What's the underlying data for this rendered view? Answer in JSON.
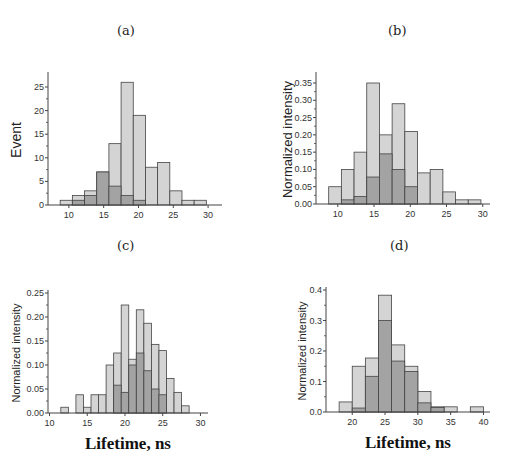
{
  "panels": [
    {
      "id": "a",
      "label": "(a)"
    },
    {
      "id": "b",
      "label": "(b)"
    },
    {
      "id": "c",
      "label": "(c)"
    },
    {
      "id": "d",
      "label": "(d)"
    }
  ],
  "colors": {
    "light_bar": "#d4d4d4",
    "dark_bar": "#a3a3a3",
    "bar_edge": "#444444",
    "axis": "#444444"
  },
  "chart_data": [
    {
      "panel": "(a)",
      "type": "bar",
      "subtype": "overlaid histogram",
      "title": "(a)",
      "xlabel": "",
      "ylabel": "Event",
      "xlim": [
        7,
        32
      ],
      "ylim": [
        0,
        27
      ],
      "xticks": [
        10,
        15,
        20,
        25,
        30
      ],
      "yticks": [
        0,
        5,
        10,
        15,
        20,
        25
      ],
      "bin_edges": [
        8.75,
        10.5,
        12.25,
        14.0,
        15.75,
        17.5,
        19.25,
        21.0,
        22.75,
        24.5,
        26.25,
        28.0,
        29.75
      ],
      "series": [
        {
          "name": "light",
          "values": [
            1,
            2,
            3,
            7,
            13,
            26,
            19,
            8,
            9,
            3,
            1,
            1
          ]
        },
        {
          "name": "dark",
          "values": [
            0,
            1,
            2,
            7,
            4,
            2,
            1,
            0,
            0,
            0,
            0,
            0
          ]
        }
      ]
    },
    {
      "panel": "(b)",
      "type": "bar",
      "subtype": "overlaid histogram",
      "title": "(b)",
      "xlabel": "",
      "ylabel": "Normalized intensity",
      "xlim": [
        7,
        31
      ],
      "ylim": [
        0,
        0.37
      ],
      "xticks": [
        10,
        15,
        20,
        25,
        30
      ],
      "yticks": [
        0.0,
        0.05,
        0.1,
        0.15,
        0.2,
        0.25,
        0.3,
        0.35
      ],
      "bin_edges": [
        8.75,
        10.5,
        12.25,
        14.0,
        15.75,
        17.5,
        19.25,
        21.0,
        22.75,
        24.5,
        26.25,
        28.0,
        29.75
      ],
      "series": [
        {
          "name": "light",
          "values": [
            0.05,
            0.1,
            0.15,
            0.35,
            0.2,
            0.29,
            0.21,
            0.09,
            0.1,
            0.035,
            0.012,
            0.012
          ]
        },
        {
          "name": "dark",
          "values": [
            0,
            0.012,
            0.022,
            0.078,
            0.145,
            0.1,
            0.05,
            0,
            0,
            0,
            0,
            0
          ]
        }
      ]
    },
    {
      "panel": "(c)",
      "type": "bar",
      "subtype": "overlaid histogram",
      "title": "(c)",
      "xlabel": "Lifetime, ns",
      "ylabel": "Normalized intensity",
      "xlim": [
        9.8,
        31
      ],
      "ylim": [
        0,
        0.25
      ],
      "xticks": [
        10,
        15,
        20,
        25,
        30
      ],
      "yticks": [
        0.0,
        0.05,
        0.1,
        0.15,
        0.2,
        0.25
      ],
      "bin_edges": [
        11.5,
        12.5,
        13.5,
        14.5,
        15.5,
        16.5,
        17.5,
        18.5,
        19.5,
        20.5,
        21.5,
        22.5,
        23.5,
        24.5,
        25.5,
        26.5,
        27.5,
        28.5
      ],
      "series": [
        {
          "name": "light",
          "values": [
            0.012,
            0,
            0.038,
            0.012,
            0.038,
            0.038,
            0.1,
            0.125,
            0.225,
            0.112,
            0.215,
            0.187,
            0.143,
            0.13,
            0.072,
            0.043,
            0.015
          ]
        },
        {
          "name": "dark",
          "values": [
            0,
            0,
            0,
            0,
            0,
            0,
            0,
            0.058,
            0.043,
            0.1,
            0.125,
            0.088,
            0.05,
            0.038,
            0,
            0,
            0
          ]
        }
      ]
    },
    {
      "panel": "(d)",
      "type": "bar",
      "subtype": "overlaid histogram",
      "title": "(d)",
      "xlabel": "Lifetime, ns",
      "ylabel": "Normalized intensity",
      "xlim": [
        16,
        41
      ],
      "ylim": [
        0,
        0.4
      ],
      "xticks": [
        20,
        25,
        30,
        35,
        40
      ],
      "yticks": [
        0.0,
        0.1,
        0.2,
        0.3,
        0.4
      ],
      "bin_edges": [
        18,
        20,
        22,
        24,
        26,
        28,
        30,
        32,
        34,
        36,
        38,
        40
      ],
      "series": [
        {
          "name": "light",
          "values": [
            0.033,
            0.15,
            0.177,
            0.383,
            0.22,
            0.15,
            0.067,
            0.017,
            0.017,
            0,
            0.017
          ]
        },
        {
          "name": "dark",
          "values": [
            0,
            0.013,
            0.117,
            0.3,
            0.167,
            0.133,
            0.03,
            0.015,
            0,
            0,
            0
          ]
        }
      ]
    }
  ],
  "layout": [
    {
      "label_x": 117,
      "label_y": 34,
      "ax_x0": 48,
      "ax_x1": 222,
      "ax_y0": 205,
      "ax_ytop": 75,
      "ylabel_x": 17,
      "ylabel_size": 14,
      "tick_fmt": 0
    },
    {
      "label_x": 388,
      "label_y": 34,
      "ax_x0": 316,
      "ax_x1": 490,
      "ax_y0": 204,
      "ax_ytop": 75,
      "ylabel_x": 289,
      "ylabel_size": 13,
      "tick_fmt": 2
    },
    {
      "label_x": 117,
      "label_y": 249,
      "ax_x0": 48,
      "ax_x1": 208,
      "ax_y0": 413,
      "ax_ytop": 293,
      "ylabel_x": 17,
      "ylabel_size": 11,
      "tick_fmt": 2
    },
    {
      "label_x": 390,
      "label_y": 249,
      "ax_x0": 326,
      "ax_x1": 490,
      "ax_y0": 412,
      "ax_ytop": 290,
      "ylabel_x": 303,
      "ylabel_size": 11,
      "tick_fmt": 1
    }
  ]
}
